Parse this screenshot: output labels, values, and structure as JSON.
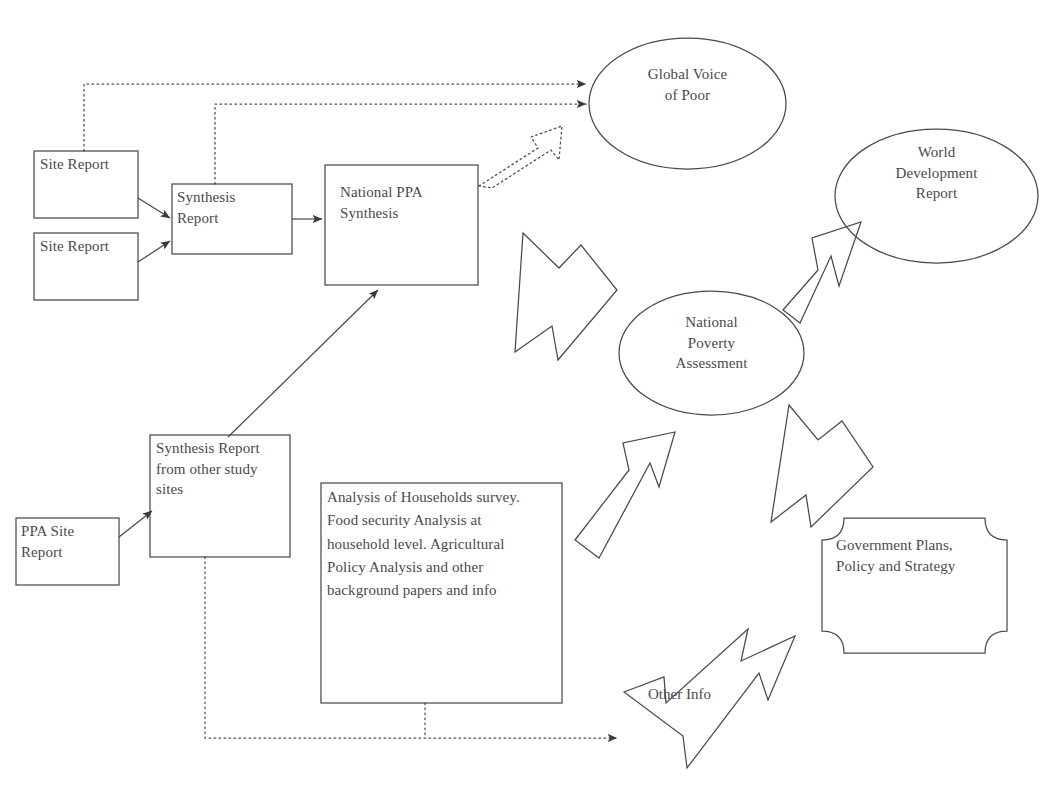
{
  "diagram": {
    "stroke_color": "#4a4a4a",
    "text_color": "#4a4a4a",
    "background_color": "#ffffff",
    "nodes": [
      {
        "id": "site-report-1",
        "label": "Site Report",
        "shape": "rectangle",
        "x": 34,
        "y": 151,
        "w": 104,
        "h": 67
      },
      {
        "id": "site-report-2",
        "label": "Site Report",
        "shape": "rectangle",
        "x": 34,
        "y": 233,
        "w": 104,
        "h": 67
      },
      {
        "id": "synthesis-report",
        "label": "Synthesis\nReport",
        "shape": "rectangle",
        "x": 172,
        "y": 184,
        "w": 120,
        "h": 70
      },
      {
        "id": "national-ppa-synthesis",
        "label": "National PPA\nSynthesis",
        "shape": "rectangle",
        "x": 325,
        "y": 165,
        "w": 153,
        "h": 120
      },
      {
        "id": "global-voice-of-poor",
        "label": "Global Voice\nof Poor",
        "shape": "ellipse",
        "x": 589,
        "y": 38,
        "w": 197,
        "h": 131
      },
      {
        "id": "world-development-report",
        "label": "World\nDevelopment\nReport",
        "shape": "ellipse",
        "x": 835,
        "y": 129,
        "w": 203,
        "h": 134
      },
      {
        "id": "national-poverty-assessment",
        "label": "National\nPoverty\nAssessment",
        "shape": "ellipse",
        "x": 619,
        "y": 291,
        "w": 185,
        "h": 124
      },
      {
        "id": "government-plans",
        "label": "Government Plans,\nPolicy and Strategy",
        "shape": "concave-corner-rectangle",
        "x": 822,
        "y": 518,
        "w": 185,
        "h": 135
      },
      {
        "id": "ppa-site-report",
        "label": "PPA Site\nReport",
        "shape": "rectangle",
        "x": 16,
        "y": 518,
        "w": 103,
        "h": 67
      },
      {
        "id": "synthesis-report-other-sites",
        "label": "Synthesis Report\nfrom other study\nsites",
        "shape": "rectangle",
        "x": 150,
        "y": 435,
        "w": 140,
        "h": 122
      },
      {
        "id": "analysis-box",
        "label": "Analysis of Households survey.\nFood security Analysis at\nhousehold level. Agricultural\nPolicy Analysis and other\nbackground papers and info",
        "shape": "rectangle",
        "x": 321,
        "y": 483,
        "w": 241,
        "h": 220
      }
    ],
    "edges": [
      {
        "id": "site-report-1-to-synthesis",
        "from": "site-report-1",
        "to": "synthesis-report",
        "style": "solid-line-arrow"
      },
      {
        "id": "site-report-2-to-synthesis",
        "from": "site-report-2",
        "to": "synthesis-report",
        "style": "solid-line-arrow"
      },
      {
        "id": "synthesis-to-national-ppa",
        "from": "synthesis-report",
        "to": "national-ppa-synthesis",
        "style": "solid-line-arrow"
      },
      {
        "id": "site-report-1-to-global-voice",
        "from": "site-report-1",
        "to": "global-voice-of-poor",
        "style": "dotted-elbow-arrow"
      },
      {
        "id": "synthesis-report-to-global-voice",
        "from": "synthesis-report",
        "to": "global-voice-of-poor",
        "style": "dotted-elbow-arrow"
      },
      {
        "id": "national-ppa-to-global-voice",
        "from": "national-ppa-synthesis",
        "to": "global-voice-of-poor",
        "style": "dotted-block-arrow"
      },
      {
        "id": "national-ppa-to-poverty-assessment",
        "from": "national-ppa-synthesis",
        "to": "national-poverty-assessment",
        "style": "block-arrow"
      },
      {
        "id": "poverty-assessment-to-wdr",
        "from": "national-poverty-assessment",
        "to": "world-development-report",
        "style": "block-arrow"
      },
      {
        "id": "poverty-assessment-to-government-plans",
        "from": "national-poverty-assessment",
        "to": "government-plans",
        "style": "block-arrow"
      },
      {
        "id": "analysis-to-poverty-assessment",
        "from": "analysis-box",
        "to": "national-poverty-assessment",
        "style": "block-arrow"
      },
      {
        "id": "ppa-site-report-to-synthesis-other",
        "from": "ppa-site-report",
        "to": "synthesis-report-other-sites",
        "style": "solid-line-arrow"
      },
      {
        "id": "synthesis-other-to-national-ppa",
        "from": "synthesis-report-other-sites",
        "to": "national-ppa-synthesis",
        "style": "solid-line-arrow"
      },
      {
        "id": "other-info-to-government-plans",
        "from": "analysis-box",
        "to": "government-plans",
        "style": "dotted-to-block-arrow",
        "label": "Other Info"
      }
    ],
    "edge_labels": [
      {
        "id": "other-info-label",
        "text": "Other Info",
        "x": 648,
        "y": 686
      }
    ]
  }
}
